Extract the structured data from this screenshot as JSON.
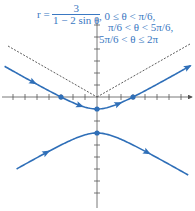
{
  "equation": {
    "lhs": "r =",
    "numerator": "3",
    "denominator": "1 − 2 sin θ",
    "conditions": [
      ", 0 ≤ θ < π/6,",
      "π/6 < θ < 5π/6,",
      "5π/6 < θ ≤ 2π"
    ]
  },
  "colors": {
    "curve": "#2f6fb8",
    "axis": "#555555",
    "asymptote": "#333333",
    "text": "#3a78c2"
  },
  "axes": {
    "origin_px": [
      97,
      97
    ],
    "unit_px": 12,
    "x_ticks": [
      -7,
      -6,
      -5,
      -4,
      -3,
      -2,
      -1,
      1,
      2,
      3,
      4,
      5,
      6,
      7
    ],
    "y_ticks": [
      6,
      5,
      4,
      3,
      2,
      1,
      -1,
      -2,
      -3,
      -4,
      -5,
      -6,
      -7,
      -8
    ]
  },
  "points": [
    {
      "x": -3,
      "y": 0
    },
    {
      "x": 3,
      "y": 0
    },
    {
      "x": 0,
      "y": -1
    },
    {
      "x": 0,
      "y": -3
    }
  ]
}
